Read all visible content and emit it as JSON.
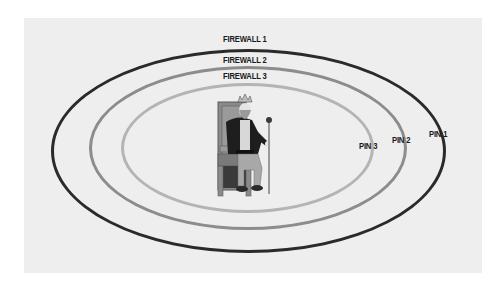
{
  "diagram": {
    "background_color": "#eeeeee",
    "rings": [
      {
        "label": "FIREWALL 1",
        "pin_label": "PIN 1",
        "color": "#2a2a2a",
        "stroke_width": 3
      },
      {
        "label": "FIREWALL 2",
        "pin_label": "PIN 2",
        "color": "#8c8c8c",
        "stroke_width": 3
      },
      {
        "label": "FIREWALL 3",
        "pin_label": "PIN 3",
        "color": "#b4b4b4",
        "stroke_width": 3
      }
    ],
    "center_figure": {
      "name": "king-on-throne",
      "description": "Bearded king with crown seated on a wooden throne holding a scepter"
    }
  }
}
